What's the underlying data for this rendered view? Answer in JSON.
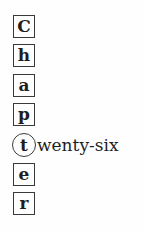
{
  "heading": {
    "letters": [
      "C",
      "h",
      "a",
      "p",
      "t",
      "e",
      "r"
    ],
    "highlighted_index": 4,
    "highlighted_suffix": "wenty-six"
  }
}
